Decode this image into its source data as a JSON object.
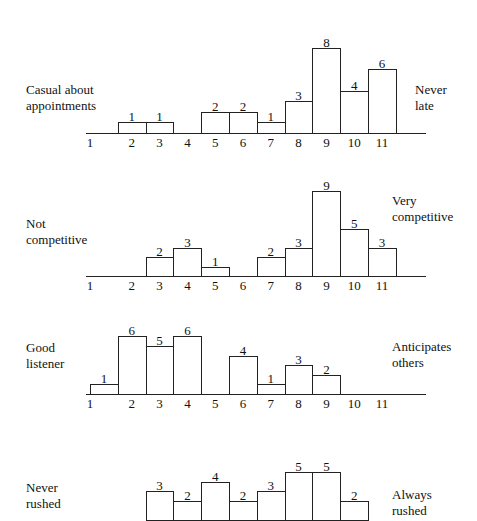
{
  "chart_data": [
    {
      "type": "bar",
      "title": "",
      "left_label": "Casual about appointments",
      "right_label": "Never late",
      "categories": [
        "1",
        "2",
        "3",
        "4",
        "5",
        "6",
        "7",
        "8",
        "9",
        "10",
        "11"
      ],
      "values": [
        0,
        1,
        1,
        0,
        2,
        2,
        1,
        3,
        8,
        4,
        6
      ],
      "xlabel": "",
      "ylabel": "",
      "grid": false
    },
    {
      "type": "bar",
      "title": "",
      "left_label": "Not competitive",
      "right_label": "Very competitive",
      "categories": [
        "1",
        "2",
        "3",
        "4",
        "5",
        "6",
        "7",
        "8",
        "9",
        "10",
        "11"
      ],
      "values": [
        0,
        0,
        2,
        3,
        1,
        0,
        2,
        3,
        9,
        5,
        3
      ],
      "xlabel": "",
      "ylabel": "",
      "grid": false
    },
    {
      "type": "bar",
      "title": "",
      "left_label": "Good listener",
      "right_label": "Anticipates others",
      "categories": [
        "1",
        "2",
        "3",
        "4",
        "5",
        "6",
        "7",
        "8",
        "9",
        "10",
        "11"
      ],
      "values": [
        1,
        6,
        5,
        6,
        0,
        4,
        1,
        3,
        2,
        0,
        0
      ],
      "xlabel": "",
      "ylabel": "",
      "grid": false
    },
    {
      "type": "bar",
      "title": "",
      "left_label": "Never rushed",
      "right_label": "Always rushed",
      "categories": [
        "1",
        "2",
        "3",
        "4",
        "5",
        "6",
        "7",
        "8",
        "9",
        "10",
        "11"
      ],
      "values": [
        0,
        0,
        3,
        2,
        4,
        2,
        3,
        5,
        5,
        2,
        0
      ],
      "xlabel": "",
      "ylabel": "",
      "grid": false,
      "note": "chart partially cut off at bottom of image"
    }
  ],
  "charts": [
    {
      "left": [
        "Casual about",
        "appointments"
      ],
      "right": [
        "Never",
        "late"
      ]
    },
    {
      "left": [
        "Not",
        "competitive"
      ],
      "right": [
        "Very",
        "competitive"
      ]
    },
    {
      "left": [
        "Good",
        "listener"
      ],
      "right": [
        "Anticipates",
        "others"
      ]
    },
    {
      "left": [
        "Never",
        "rushed"
      ],
      "right": [
        "Always",
        "rushed"
      ]
    }
  ]
}
